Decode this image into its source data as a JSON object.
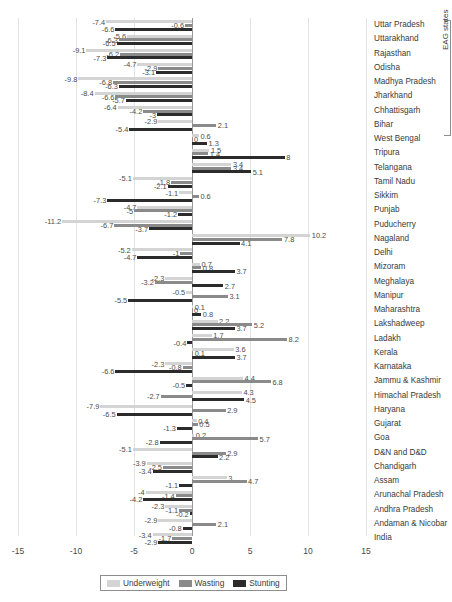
{
  "chart_data": {
    "type": "bar",
    "orientation": "horizontal",
    "title": "",
    "subtitle": "",
    "xlabel": "",
    "ylabel": "",
    "xlim": [
      -15,
      15
    ],
    "xticks": [
      -15,
      -10,
      -5,
      0,
      5,
      10,
      15
    ],
    "grid": true,
    "legend_position": "bottom",
    "legend": [
      "Underweight",
      "Wasting",
      "Stunting"
    ],
    "colors": {
      "underweight": "#d4d4d4",
      "wasting": "#8a8a8a",
      "stunting": "#2b2b2b",
      "zero_axis": "#9a9a9a",
      "gridline": "#e3e3e3"
    },
    "annotations": {
      "group_bracket_label": "EAG states",
      "group_bracket_members": [
        "Uttar Pradesh",
        "Uttarakhand",
        "Rajasthan",
        "Odisha",
        "Madhya Pradesh",
        "Jharkhand",
        "Chhattisgarh",
        "Bihar"
      ]
    },
    "categories": [
      "Uttar Pradesh",
      "Uttarakhand",
      "Rajasthan",
      "Odisha",
      "Madhya Pradesh",
      "Jharkhand",
      "Chhattisgarh",
      "Bihar",
      "West Bengal",
      "Tripura",
      "Telangana",
      "Tamil Nadu",
      "Sikkim",
      "Punjab",
      "Puducherry",
      "Nagaland",
      "Delhi",
      "Mizoram",
      "Meghalaya",
      "Manipur",
      "Maharashtra",
      "Lakshadweep",
      "Ladakh",
      "Kerala",
      "Karnataka",
      "Jammu & Kashmir",
      "Himachal Pradesh",
      "Haryana",
      "Gujarat",
      "Goa",
      "D&N and D&D",
      "Chandigarh",
      "Assam",
      "Arunachal Pradesh",
      "Andhra Pradesh",
      "Andaman & Nicobar",
      "India"
    ],
    "series": [
      {
        "name": "Underweight",
        "color": "#d4d4d4",
        "values": [
          -7.4,
          -5.6,
          -9.1,
          -4.7,
          -9.8,
          -8.4,
          -6.4,
          -2.9,
          0.6,
          1.5,
          3.4,
          -5.1,
          -1.1,
          -4.7,
          -11.2,
          10.2,
          -5.2,
          0.7,
          -2.3,
          -0.5,
          0.1,
          2.2,
          1.7,
          3.6,
          -2.3,
          4.4,
          4.3,
          -7.9,
          0.4,
          0.2,
          -5.1,
          -3.9,
          3,
          -4,
          -2.3,
          -2.9,
          -3.4
        ]
      },
      {
        "name": "Wasting",
        "color": "#8a8a8a",
        "values": [
          -0.6,
          -6.3,
          -6.2,
          -2.9,
          -6.8,
          -6.6,
          -4.2,
          2.1,
          0,
          1.4,
          3.4,
          -1.8,
          0.6,
          -5,
          -6.7,
          7.8,
          -1,
          0.8,
          -3.2,
          3.1,
          0,
          5.2,
          8.2,
          0.1,
          -0.8,
          6.8,
          -2.7,
          2.9,
          0.5,
          5.7,
          2.9,
          -2.5,
          4.7,
          -1.4,
          -1.1,
          2.1,
          -1.7
        ]
      },
      {
        "name": "Stunting",
        "color": "#2b2b2b",
        "values": [
          -6.6,
          -6.5,
          -7.3,
          -3.1,
          -6.3,
          -5.7,
          -3,
          -5.4,
          1.3,
          8,
          5.1,
          -2.1,
          -7.3,
          -1.2,
          -3.7,
          4.1,
          -4.7,
          3.7,
          2.7,
          -5.5,
          0.8,
          3.7,
          -0.4,
          3.7,
          -6.6,
          -0.5,
          4.5,
          -6.5,
          -1.3,
          -2.8,
          2.2,
          -3.4,
          -1.1,
          -4.2,
          -0.2,
          -0.8,
          -2.9
        ]
      }
    ],
    "value_labels": {
      "Uttar Pradesh": {
        "underweight": "-7.4",
        "wasting": "-0.6",
        "stunting": "-6.6"
      },
      "Uttarakhand": {
        "underweight": "-5.6",
        "wasting": "-6.3",
        "stunting": "-6.5"
      },
      "Rajasthan": {
        "underweight": "-9.1",
        "wasting": "-6.2",
        "stunting": "-7.3"
      },
      "Odisha": {
        "underweight": "-4.7",
        "wasting": "-2.9",
        "stunting": "-3.1"
      },
      "Madhya Pradesh": {
        "underweight": "-9.8",
        "wasting": "-6.8",
        "stunting": "-6.3"
      },
      "Jharkhand": {
        "underweight": "-8.4",
        "wasting": "-6.6",
        "stunting": "-5.7"
      },
      "Chhattisgarh": {
        "underweight": "-6.4",
        "wasting": "-4.2",
        "stunting": "-3"
      },
      "Bihar": {
        "underweight": "-2.9",
        "wasting": "2.1",
        "stunting": "-5.4"
      },
      "West Bengal": {
        "underweight": "0.6",
        "wasting": "0",
        "stunting": "1.3"
      },
      "Tripura": {
        "underweight": "1.5",
        "wasting": "1.4",
        "stunting": "8"
      },
      "Telangana": {
        "underweight": "3.4",
        "wasting": "3.4",
        "stunting": "5.1"
      },
      "Tamil Nadu": {
        "underweight": "-5.1",
        "wasting": "-1.8",
        "stunting": "-2.1"
      },
      "Sikkim": {
        "underweight": "-1.1",
        "wasting": "0.6",
        "stunting": "-7.3"
      },
      "Punjab": {
        "underweight": "-4.7",
        "wasting": "-5",
        "stunting": "-1.2"
      },
      "Puducherry": {
        "underweight": "-11.2",
        "wasting": "-6.7",
        "stunting": "-3.7"
      },
      "Nagaland": {
        "underweight": "10.2",
        "wasting": "7.8",
        "stunting": "4.1"
      },
      "Delhi": {
        "underweight": "-5.2",
        "wasting": "-1",
        "stunting": "-4.7"
      },
      "Mizoram": {
        "underweight": "0.7",
        "wasting": "0.8",
        "stunting": "3.7"
      },
      "Meghalaya": {
        "underweight": "-2.3",
        "wasting": "-3.2",
        "stunting": "2.7"
      },
      "Manipur": {
        "underweight": "-0.5",
        "wasting": "3.1",
        "stunting": "-5.5"
      },
      "Maharashtra": {
        "underweight": "0.1",
        "wasting": "0",
        "stunting": "0.8"
      },
      "Lakshadweep": {
        "underweight": "2.2",
        "wasting": "5.2",
        "stunting": "3.7"
      },
      "Ladakh": {
        "underweight": "1.7",
        "wasting": "8.2",
        "stunting": "-0.4"
      },
      "Kerala": {
        "underweight": "3.6",
        "wasting": "0.1",
        "stunting": "3.7"
      },
      "Karnataka": {
        "underweight": "-2.3",
        "wasting": "-0.8",
        "stunting": "-6.6"
      },
      "Jammu & Kashmir": {
        "underweight": "4.4",
        "wasting": "6.8",
        "stunting": "-0.5"
      },
      "Himachal Pradesh": {
        "underweight": "4.3",
        "wasting": "-2.7",
        "stunting": "4.5"
      },
      "Haryana": {
        "underweight": "-7.9",
        "wasting": "2.9",
        "stunting": "-6.5"
      },
      "Gujarat": {
        "underweight": "0.4",
        "wasting": "0.5",
        "stunting": "-1.3"
      },
      "Goa": {
        "underweight": "0.2",
        "wasting": "5.7",
        "stunting": "-2.8"
      },
      "D&N and D&D": {
        "underweight": "-5.1",
        "wasting": "2.9",
        "stunting": "2.2"
      },
      "Chandigarh": {
        "underweight": "-3.9",
        "wasting": "-2.5",
        "stunting": "-3.4"
      },
      "Assam": {
        "underweight": "3",
        "wasting": "4.7",
        "stunting": "-1.1"
      },
      "Arunachal Pradesh": {
        "underweight": "-4",
        "wasting": "-1.4",
        "stunting": "-4.2"
      },
      "Andhra Pradesh": {
        "underweight": "-2.3",
        "wasting": "-1.1",
        "stunting": "-0.2"
      },
      "Andaman & Nicobar": {
        "underweight": "-2.9",
        "wasting": "2.1",
        "stunting": "-0.8"
      },
      "India": {
        "underweight": "-3.4",
        "wasting": "-1.7",
        "stunting": "-2.9"
      }
    }
  }
}
